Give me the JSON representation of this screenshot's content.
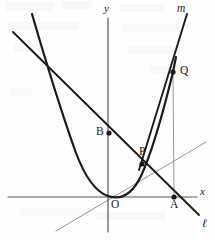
{
  "figure": {
    "background_color": "#fefefe",
    "ink_color": "#1a1a1a",
    "thin_color": "#8a8a8a",
    "width": 215,
    "height": 240
  },
  "axes": {
    "x_label": "x",
    "y_label": "y",
    "origin_label": "O",
    "x_axis": {
      "x1": 8,
      "y1": 197,
      "x2": 197,
      "y2": 197
    },
    "y_axis": {
      "x1": 108,
      "y1": 18,
      "x2": 108,
      "y2": 232
    },
    "x_label_pos": {
      "x": 200,
      "y": 186
    },
    "y_label_pos": {
      "x": 104,
      "y": 3
    },
    "origin_label_pos": {
      "x": 111,
      "y": 199
    }
  },
  "curves": {
    "parabola": {
      "name": "parabola",
      "path": "M 32 14 Q 57 100 76 153 Q 90 190 108 196 Q 128 203 141 176 Q 155 146 173 72 L 176 57",
      "stroke_width": 2.2
    },
    "line_l": {
      "name": "line-l",
      "label": "ℓ",
      "x1": 13,
      "y1": 32,
      "x2": 199,
      "y2": 215,
      "label_pos": {
        "x": 202,
        "y": 218
      },
      "stroke_width": 1.9
    },
    "line_m": {
      "name": "line-m",
      "label": "m",
      "x1": 187,
      "y1": 14,
      "x2": 139,
      "y2": 170,
      "label_pos": {
        "x": 177,
        "y": 3
      },
      "stroke_width": 1.9
    },
    "thin_diagonal": {
      "name": "thin-diagonal-line",
      "x1": 56,
      "y1": 231,
      "x2": 206,
      "y2": 142,
      "stroke_width": 0.9
    },
    "vertical_qa": {
      "name": "vertical-segment-q-to-a",
      "x1": 173,
      "y1": 72,
      "x2": 174,
      "y2": 197,
      "stroke_width": 0.9
    }
  },
  "points": [
    {
      "id": "B",
      "label": "B",
      "x": 109,
      "y": 133,
      "label_x": 96,
      "label_y": 126
    },
    {
      "id": "P",
      "label": "P",
      "x": 142,
      "y": 164,
      "label_x": 139,
      "label_y": 146
    },
    {
      "id": "Q",
      "label": "Q",
      "x": 173,
      "y": 72,
      "label_x": 180,
      "label_y": 65
    },
    {
      "id": "A",
      "label": "A",
      "x": 174,
      "y": 197,
      "label_x": 170,
      "label_y": 199
    }
  ],
  "dot_radius": 2.6
}
